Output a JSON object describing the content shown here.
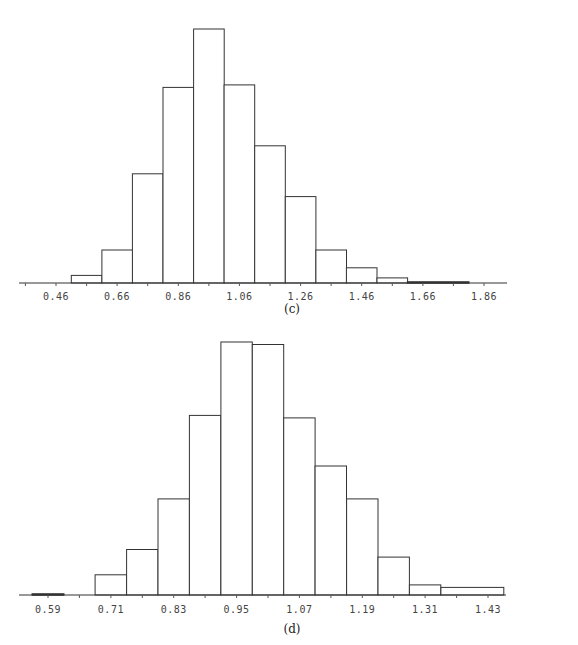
{
  "chart_data": [
    {
      "type": "bar",
      "subtype": "histogram",
      "title": "",
      "caption": "(c)",
      "xlabel": "",
      "ylabel": "",
      "grid": false,
      "legend": null,
      "x_tick_labels": [
        "0.46",
        "0.66",
        "0.86",
        "1.06",
        "1.26",
        "1.46",
        "1.66",
        "1.86"
      ],
      "x_ticks": [
        0.46,
        0.66,
        0.86,
        1.06,
        1.26,
        1.46,
        1.66,
        1.86
      ],
      "xlim": [
        0.36,
        1.96
      ],
      "bin_width": 0.1,
      "bins": [
        {
          "start": 0.51,
          "end": 0.61,
          "value": 3
        },
        {
          "start": 0.61,
          "end": 0.71,
          "value": 13
        },
        {
          "start": 0.71,
          "end": 0.81,
          "value": 43
        },
        {
          "start": 0.81,
          "end": 0.91,
          "value": 77
        },
        {
          "start": 0.91,
          "end": 1.01,
          "value": 100
        },
        {
          "start": 1.01,
          "end": 1.11,
          "value": 78
        },
        {
          "start": 1.11,
          "end": 1.21,
          "value": 54
        },
        {
          "start": 1.21,
          "end": 1.31,
          "value": 34
        },
        {
          "start": 1.31,
          "end": 1.41,
          "value": 13
        },
        {
          "start": 1.41,
          "end": 1.51,
          "value": 6
        },
        {
          "start": 1.51,
          "end": 1.61,
          "value": 2
        },
        {
          "start": 1.61,
          "end": 1.81,
          "value": 0.4
        }
      ],
      "ylim": [
        0,
        100
      ],
      "y_units": "relative frequency (peak = 100)"
    },
    {
      "type": "bar",
      "subtype": "histogram",
      "title": "",
      "caption": "(d)",
      "xlabel": "",
      "ylabel": "",
      "grid": false,
      "legend": null,
      "x_tick_labels": [
        "0.59",
        "0.71",
        "0.83",
        "0.95",
        "1.07",
        "1.19",
        "1.31",
        "1.43"
      ],
      "x_ticks": [
        0.59,
        0.71,
        0.83,
        0.95,
        1.07,
        1.19,
        1.31,
        1.43
      ],
      "xlim": [
        0.53,
        1.49
      ],
      "bin_width": 0.06,
      "bins": [
        {
          "start": 0.56,
          "end": 0.62,
          "value": 0.4
        },
        {
          "start": 0.68,
          "end": 0.74,
          "value": 8
        },
        {
          "start": 0.74,
          "end": 0.8,
          "value": 18
        },
        {
          "start": 0.8,
          "end": 0.86,
          "value": 38
        },
        {
          "start": 0.86,
          "end": 0.92,
          "value": 71
        },
        {
          "start": 0.92,
          "end": 0.98,
          "value": 100
        },
        {
          "start": 0.98,
          "end": 1.04,
          "value": 99
        },
        {
          "start": 1.04,
          "end": 1.1,
          "value": 70
        },
        {
          "start": 1.1,
          "end": 1.16,
          "value": 51
        },
        {
          "start": 1.16,
          "end": 1.22,
          "value": 38
        },
        {
          "start": 1.22,
          "end": 1.28,
          "value": 15
        },
        {
          "start": 1.28,
          "end": 1.34,
          "value": 4
        },
        {
          "start": 1.34,
          "end": 1.46,
          "value": 3
        }
      ],
      "ylim": [
        0,
        100
      ],
      "y_units": "relative frequency (peak = 100)"
    }
  ]
}
